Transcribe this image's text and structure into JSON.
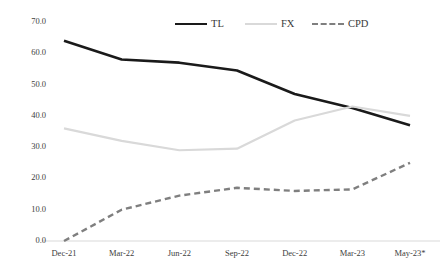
{
  "chart_data": {
    "type": "line",
    "title": "",
    "subtitle": "",
    "xlabel": "",
    "ylabel": "",
    "categories": [
      "Dec-21",
      "Mar-22",
      "Jun-22",
      "Sep-22",
      "Dec-22",
      "Mar-23",
      "May-23*"
    ],
    "ylim": [
      0,
      70
    ],
    "ytick_labels": [
      "0.0",
      "10.0",
      "20.0",
      "30.0",
      "40.0",
      "50.0",
      "60.0",
      "70.0"
    ],
    "ytick_values": [
      0,
      10,
      20,
      30,
      40,
      50,
      60,
      70
    ],
    "grid": false,
    "legend_position": "top-center",
    "series": [
      {
        "name": "TL",
        "values": [
          64.0,
          58.0,
          57.0,
          54.5,
          47.0,
          42.5,
          37.0
        ],
        "color": "#1a1a1a",
        "style": "solid",
        "width": 2.6
      },
      {
        "name": "FX",
        "values": [
          36.0,
          32.0,
          29.0,
          29.5,
          38.5,
          43.0,
          40.0
        ],
        "color": "#d9d9d9",
        "style": "solid",
        "width": 2.2
      },
      {
        "name": "CPD",
        "values": [
          0.0,
          10.0,
          14.5,
          17.0,
          16.0,
          16.5,
          25.0
        ],
        "color": "#7f7f7f",
        "style": "dashed",
        "width": 2.4
      }
    ]
  },
  "legend": {
    "items": [
      {
        "label": "TL"
      },
      {
        "label": "FX"
      },
      {
        "label": "CPD"
      }
    ]
  },
  "axis": {
    "baseline_color": "#d9d9d9"
  }
}
